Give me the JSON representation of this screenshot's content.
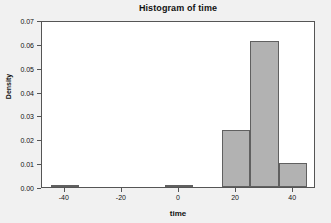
{
  "chart_data": {
    "type": "bar",
    "title": "Histogram of time",
    "xlabel": "time",
    "ylabel": "Density",
    "grid": false,
    "legend": null,
    "xlim": [
      -48,
      48
    ],
    "ylim": [
      0,
      0.07
    ],
    "x_ticks": [
      -40,
      -20,
      0,
      20,
      40
    ],
    "x_tick_labels": [
      "-40",
      "-20",
      "0",
      "20",
      "40"
    ],
    "y_ticks": [
      0.0,
      0.01,
      0.02,
      0.03,
      0.04,
      0.05,
      0.06,
      0.07
    ],
    "y_tick_labels": [
      "0.00",
      "0.01",
      "0.02",
      "0.03",
      "0.04",
      "0.05",
      "0.06",
      "0.07"
    ],
    "bin_width": 10,
    "bins": [
      {
        "left": -45,
        "right": -35,
        "density": 0.001
      },
      {
        "left": -5,
        "right": 5,
        "density": 0.001
      },
      {
        "left": 15,
        "right": 25,
        "density": 0.024
      },
      {
        "left": 25,
        "right": 35,
        "density": 0.061
      },
      {
        "left": 35,
        "right": 45,
        "density": 0.01
      }
    ],
    "categories": [
      "-45 to -35",
      "-5 to 5",
      "15 to 25",
      "25 to 35",
      "35 to 45"
    ],
    "values": [
      0.001,
      0.001,
      0.024,
      0.061,
      0.01
    ],
    "colors": {
      "bar_fill": "#b2b2b2",
      "bar_edge": "#606060",
      "panel_background": "#ffffff",
      "figure_background": "#f1f1f1",
      "axis": "#555555",
      "text": "#111111"
    }
  }
}
